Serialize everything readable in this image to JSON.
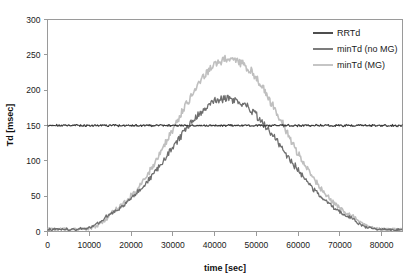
{
  "chart_data": {
    "type": "line",
    "title": "",
    "xlabel": "time [sec]",
    "ylabel": "Td [msec]",
    "xlim": [
      0,
      85000
    ],
    "ylim": [
      0,
      300
    ],
    "xticks": [
      0,
      10000,
      20000,
      30000,
      40000,
      50000,
      60000,
      70000,
      80000
    ],
    "xtick_labels": [
      "0",
      "10000",
      "20000",
      "30000",
      "40000",
      "50000",
      "60000",
      "70000",
      "80000"
    ],
    "yticks": [
      0,
      50,
      100,
      150,
      200,
      250,
      300
    ],
    "ytick_labels": [
      "0",
      "50",
      "100",
      "150",
      "200",
      "250",
      "300"
    ],
    "grid": false,
    "legend_position": "top-right",
    "noise_amplitude": 3.5,
    "series": [
      {
        "name": "RRTd",
        "color": "#3a3a3a",
        "line_width": 1.2,
        "shape": "constant",
        "constant_value": 150,
        "noise": 1.2,
        "x_start": 0,
        "x_end": 85000
      },
      {
        "name": "minTd (no MG)",
        "color": "#6e6e6e",
        "line_width": 1.3,
        "shape": "bell",
        "baseline": 3,
        "peak_value": 188,
        "peak_x": 43000,
        "rise_start_x": 14000,
        "fall_end_x": 73000,
        "width_sigma": 13500,
        "noise": 3.5,
        "x_start": 0,
        "x_end": 85000
      },
      {
        "name": "minTd (MG)",
        "color": "#bfbfbf",
        "line_width": 1.6,
        "shape": "bell",
        "baseline": 3,
        "peak_value": 245,
        "peak_x": 43500,
        "rise_start_x": 15000,
        "fall_end_x": 74000,
        "width_sigma": 13000,
        "noise": 4.0,
        "x_start": 0,
        "x_end": 85000
      }
    ],
    "annotations": []
  },
  "legend": {
    "entries": [
      {
        "label": "RRTd",
        "color": "#3a3a3a"
      },
      {
        "label": "minTd (no MG)",
        "color": "#6e6e6e"
      },
      {
        "label": "minTd (MG)",
        "color": "#bfbfbf"
      }
    ]
  },
  "axes": {
    "x_title": "time [sec]",
    "y_title": "Td [msec]"
  }
}
